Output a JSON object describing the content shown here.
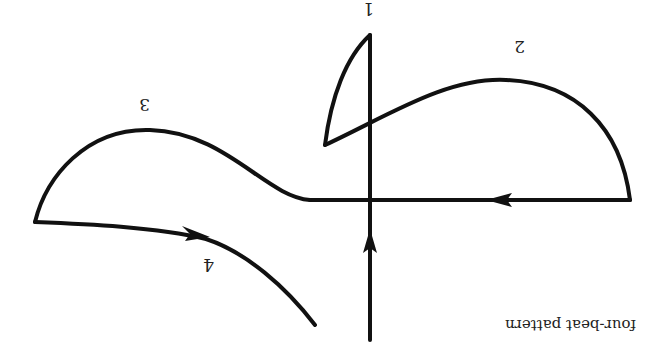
{
  "diagram": {
    "title": "four-beat pattern",
    "orientation": "rotated 180 degrees (upside-down)",
    "beats": [
      {
        "number": "1",
        "label": "1"
      },
      {
        "number": "2",
        "label": "2"
      },
      {
        "number": "3",
        "label": "3"
      },
      {
        "number": "4",
        "label": "4"
      }
    ],
    "colors": {
      "stroke": "#111111",
      "background": "#ffffff"
    }
  }
}
